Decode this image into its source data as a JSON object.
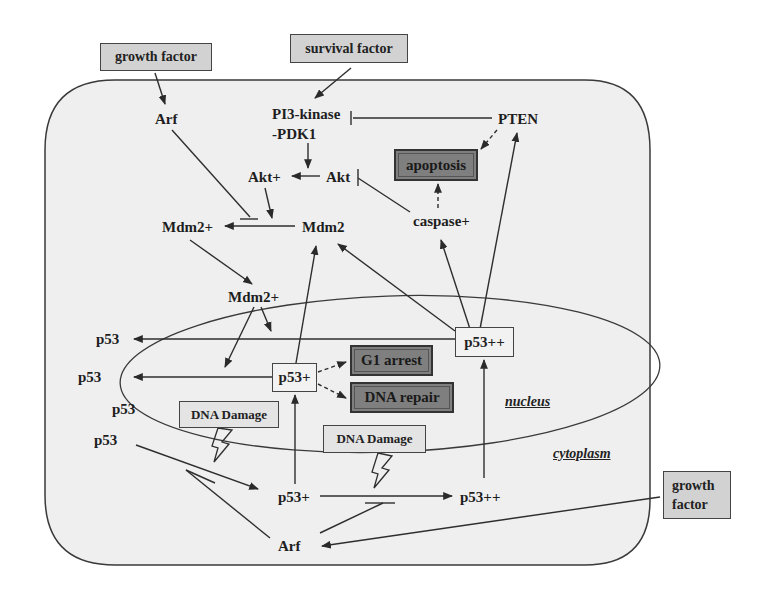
{
  "diagram": {
    "type": "signaling-pathway",
    "colors": {
      "cell_fill": "#efefef",
      "line": "#3a3a3a",
      "stimulus_box": "#d2d2d2",
      "outcome_box": "#7f7f7f",
      "plain_box": "#f2f2f2"
    },
    "external": {
      "growth_factor_top": "growth factor",
      "survival_factor": "survival factor",
      "growth_factor_right_line1": "growth",
      "growth_factor_right_line2": "factor"
    },
    "nodes": {
      "arf_top": "Arf",
      "pi3k_line1": "PI3-kinase",
      "pi3k_line2": "-PDK1",
      "pten": "PTEN",
      "akt_plus": "Akt+",
      "akt": "Akt",
      "mdm2_plus_cyto": "Mdm2+",
      "mdm2": "Mdm2",
      "caspase_plus": "caspase+",
      "mdm2_plus_nuc": "Mdm2+",
      "p53_1": "p53",
      "p53_2": "p53",
      "p53_3": "p53",
      "p53_4": "p53",
      "p53_plus_nuc": "p53+",
      "p53_pp_nuc": "p53++",
      "p53_plus_cyto": "p53+",
      "p53_pp_cyto": "p53++",
      "arf_bottom": "Arf"
    },
    "outcomes": {
      "apoptosis": "apoptosis",
      "g1_arrest": "G1 arrest",
      "dna_repair": "DNA repair"
    },
    "stimuli": {
      "dna_damage_1": "DNA Damage",
      "dna_damage_2": "DNA Damage"
    },
    "regions": {
      "nucleus": "nucleus",
      "cytoplasm": "cytoplasm"
    },
    "edges": [
      {
        "from": "growth factor",
        "to": "Arf",
        "type": "activates"
      },
      {
        "from": "survival factor",
        "to": "PI3-kinase-PDK1",
        "type": "activates"
      },
      {
        "from": "PTEN",
        "to": "PI3-kinase-PDK1",
        "type": "inhibits"
      },
      {
        "from": "PTEN",
        "to": "apoptosis",
        "type": "promotes-dashed"
      },
      {
        "from": "PI3-kinase-PDK1",
        "to": "Akt+",
        "type": "activates"
      },
      {
        "from": "Akt",
        "to": "Akt+",
        "type": "converts"
      },
      {
        "from": "caspase+",
        "to": "Akt",
        "type": "inhibits"
      },
      {
        "from": "caspase+",
        "to": "apoptosis",
        "type": "promotes-dashed"
      },
      {
        "from": "Akt+",
        "to": "Mdm2 conversion",
        "type": "activates"
      },
      {
        "from": "Arf",
        "to": "Mdm2 conversion",
        "type": "inhibits"
      },
      {
        "from": "Mdm2",
        "to": "Mdm2+",
        "type": "converts"
      },
      {
        "from": "Mdm2+",
        "to": "Mdm2+ (nucleus)",
        "type": "translocates"
      },
      {
        "from": "Mdm2+ (nucleus)",
        "to": "p53 degradation",
        "type": "promotes"
      },
      {
        "from": "p53++",
        "to": "p53",
        "type": "converts"
      },
      {
        "from": "p53+",
        "to": "p53",
        "type": "converts"
      },
      {
        "from": "p53+",
        "to": "Mdm2",
        "type": "induces"
      },
      {
        "from": "p53++",
        "to": "Mdm2",
        "type": "induces"
      },
      {
        "from": "p53++",
        "to": "caspase+",
        "type": "induces"
      },
      {
        "from": "p53++",
        "to": "PTEN",
        "type": "induces"
      },
      {
        "from": "p53+",
        "to": "G1 arrest",
        "type": "promotes-dashed"
      },
      {
        "from": "p53+",
        "to": "DNA repair",
        "type": "promotes-dashed"
      },
      {
        "from": "p53",
        "to": "p53+ (cytoplasm)",
        "type": "converts"
      },
      {
        "from": "p53+ (cytoplasm)",
        "to": "p53+ (nucleus)",
        "type": "translocates"
      },
      {
        "from": "p53+ (cytoplasm)",
        "to": "p53++ (cytoplasm)",
        "type": "converts"
      },
      {
        "from": "p53++ (cytoplasm)",
        "to": "p53++ (nucleus)",
        "type": "translocates"
      },
      {
        "from": "Arf",
        "to": "p53 conversion",
        "type": "promotes"
      },
      {
        "from": "Arf",
        "to": "p53+ conversion",
        "type": "promotes"
      },
      {
        "from": "growth factor",
        "to": "Arf (bottom)",
        "type": "activates"
      },
      {
        "from": "DNA Damage",
        "to": "p53 conversion",
        "type": "lightning"
      },
      {
        "from": "DNA Damage",
        "to": "p53+ conversion",
        "type": "lightning"
      }
    ]
  }
}
